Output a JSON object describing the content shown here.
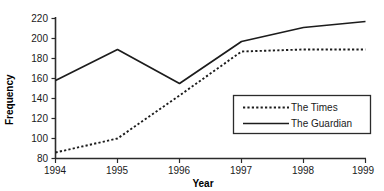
{
  "chart_data": {
    "type": "line",
    "title": "",
    "xlabel": "Year",
    "ylabel": "Frequency",
    "categories": [
      "1994",
      "1995",
      "1996",
      "1997",
      "1998",
      "1999"
    ],
    "x": [
      1994,
      1995,
      1996,
      1997,
      1998,
      1999
    ],
    "xlim": [
      1994,
      1999
    ],
    "ylim": [
      80,
      220
    ],
    "yticks": [
      80,
      100,
      120,
      140,
      160,
      180,
      200,
      220
    ],
    "ytick_labels": [
      "80",
      "100",
      "120",
      "140",
      "160",
      "180",
      "200",
      "220"
    ],
    "xticks": [
      1994,
      1995,
      1996,
      1997,
      1998,
      1999
    ],
    "xtick_labels": [
      "1994",
      "1995",
      "1996",
      "1997",
      "1998",
      "1999"
    ],
    "grid": false,
    "legend_position": "center-right",
    "series": [
      {
        "name": "The Times",
        "style": "dotted",
        "color": "#1c1c1c",
        "values": [
          86,
          100,
          143,
          187,
          189,
          189
        ]
      },
      {
        "name": "The Guardian",
        "style": "solid",
        "color": "#1c1c1c",
        "values": [
          158,
          189,
          155,
          197,
          211,
          217
        ]
      }
    ]
  },
  "axes": {
    "y_title": "Frequency",
    "x_title": "Year"
  },
  "legend": {
    "entries": [
      {
        "label": "The Times",
        "style": "dotted"
      },
      {
        "label": "The Guardian",
        "style": "solid"
      }
    ]
  }
}
